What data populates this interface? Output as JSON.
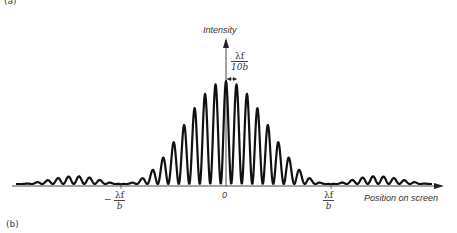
{
  "figure": {
    "panel_top_label": "(a)",
    "panel_label": "(b)",
    "y_axis_label": "Intensity",
    "x_axis_label": "Position on screen",
    "origin_label": "0",
    "fringe_spacing": {
      "numerator": "λf",
      "denominator": "10b"
    },
    "left_zero": {
      "sign": "−",
      "numerator": "λf",
      "denominator": "b"
    },
    "right_zero": {
      "numerator": "λf",
      "denominator": "b"
    }
  },
  "chart_data": {
    "type": "line",
    "xlabel": "Position on screen",
    "ylabel": "Intensity",
    "x_ticks": [
      "−λf/b",
      "0",
      "λf/b"
    ],
    "envelope_first_zero_x": 1.0,
    "fringe_spacing_x": 0.1,
    "x_range": [
      -2.0,
      2.05
    ],
    "model": "I(x) = sinc²(π x) · cos²(π x / 0.1)",
    "central_peak_intensity": 1.0,
    "fringes_within_central_max": 19,
    "peak_relative_heights_from_center": [
      1.0,
      0.97,
      0.88,
      0.76,
      0.57,
      0.41,
      0.26,
      0.14,
      0.06,
      0.02
    ],
    "grid": false,
    "legend": null
  },
  "colors": {
    "curve": "#111111",
    "axis": "#333333",
    "background": "#ffffff"
  }
}
